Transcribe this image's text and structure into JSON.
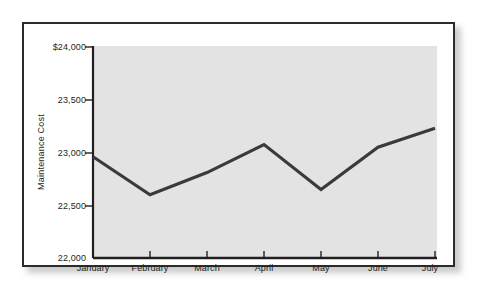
{
  "chart_data": {
    "type": "line",
    "title": "",
    "subtitle": "",
    "xlabel": "",
    "ylabel": "Maintenance Cost",
    "categories": [
      "January",
      "February",
      "March",
      "April",
      "May",
      "June",
      "July"
    ],
    "values": [
      22960,
      22600,
      22810,
      23075,
      22650,
      23050,
      23230
    ],
    "series": [
      {
        "name": "Maintenance Cost",
        "values": [
          22960,
          22600,
          22810,
          23075,
          22650,
          23050,
          23230
        ]
      }
    ],
    "ylim": [
      22000,
      24000
    ],
    "y_ticks": [
      22000,
      22500,
      23000,
      23500,
      24000
    ],
    "y_tick_labels": [
      "22,000",
      "22,500",
      "23,000",
      "23,500",
      "$24,000"
    ],
    "x_tick_labels": [
      "January",
      "February",
      "March",
      "April",
      "May",
      "June",
      "July"
    ],
    "grid": false,
    "legend": "none",
    "line_color": "#3a3a3a",
    "plot_background": "#e3e3e3",
    "axis_color": "#231f20",
    "frame_color": "#2b2b2b",
    "page_background": "#ffffff"
  },
  "figure": {
    "y_axis_title": "Maintenance Cost"
  }
}
